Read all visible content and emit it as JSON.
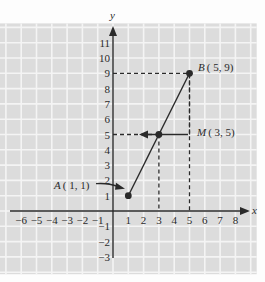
{
  "diagram": {
    "type": "coordinate-plane-midpoint",
    "axes": {
      "x_label": "x",
      "y_label": "y",
      "x_ticks": [
        "-6",
        "-5",
        "-4",
        "-3",
        "-2",
        "-1",
        "1",
        "2",
        "3",
        "4",
        "5",
        "6",
        "7",
        "8"
      ],
      "y_ticks": [
        "-3",
        "-2",
        "-1",
        "1",
        "2",
        "3",
        "4",
        "5",
        "6",
        "7",
        "8",
        "9",
        "10",
        "11"
      ],
      "x_range": [
        -7,
        9
      ],
      "y_range": [
        -4,
        12
      ]
    },
    "points": [
      {
        "name": "A",
        "label": "A ( 1, 1)",
        "x": 1,
        "y": 1
      },
      {
        "name": "M",
        "label": "M ( 3, 5)",
        "x": 3,
        "y": 5
      },
      {
        "name": "B",
        "label": "B ( 5, 9)",
        "x": 5,
        "y": 9
      }
    ],
    "segment": {
      "from": "A",
      "to": "B"
    },
    "colors": {
      "grid_bg": "#dcdcdc",
      "grid_line": "#f4f4f4",
      "ink": "#2a2a2a"
    }
  },
  "labels": {
    "A": "A ( 1, 1)",
    "M": "M ( 3, 5)",
    "B": "B ( 5, 9)",
    "x_axis": "x",
    "y_axis": "y"
  }
}
